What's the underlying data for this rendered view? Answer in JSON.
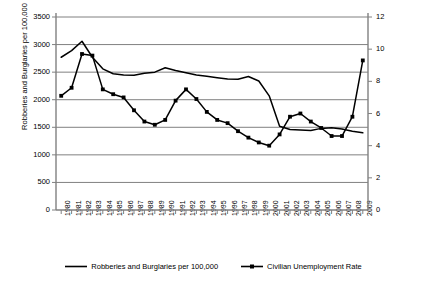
{
  "chart_data": {
    "type": "line",
    "title": "",
    "xlabel": "",
    "ylabel": "Robberies and Burglaries per 100,000",
    "ylabel_secondary": "Percentage Unemployed",
    "grid": true,
    "legend_position": "bottom",
    "categories": [
      "1980",
      "1981",
      "1982",
      "1983",
      "1984",
      "1985",
      "1986",
      "1987",
      "1988",
      "1989",
      "1990",
      "1991",
      "1992",
      "1993",
      "1994",
      "1995",
      "1996",
      "1997",
      "1998",
      "1999",
      "2000",
      "2001",
      "2002",
      "2003",
      "2004",
      "2005",
      "2006",
      "2007",
      "2008",
      "2009"
    ],
    "yaxis_left": {
      "label": "Robberies and Burglaries per 100,000",
      "ticks": [
        0,
        500,
        1000,
        1500,
        2000,
        2500,
        3000,
        3500
      ],
      "ylim": [
        0,
        3500
      ]
    },
    "yaxis_right": {
      "label": "Percentage Unemployed",
      "ticks": [
        0,
        2,
        4,
        6,
        8,
        10,
        12
      ],
      "ylim": [
        0,
        12
      ]
    },
    "series": [
      {
        "name": "Robberies and Burglaries per 100,000",
        "axis": "left",
        "marker": "none",
        "color": "#000000",
        "values": [
          2770,
          2890,
          3060,
          2770,
          2560,
          2470,
          2450,
          2445,
          2480,
          2500,
          2580,
          2530,
          2490,
          2450,
          2425,
          2400,
          2375,
          2370,
          2420,
          2340,
          2070,
          1520,
          1460,
          1450,
          1440,
          1480,
          1490,
          1470,
          1430,
          1400
        ]
      },
      {
        "name": "Civilian Unemployment Rate",
        "axis": "right",
        "marker": "square",
        "color": "#000000",
        "values": [
          7.1,
          7.6,
          9.7,
          9.6,
          7.5,
          7.2,
          7.0,
          6.2,
          5.5,
          5.3,
          5.6,
          6.8,
          7.5,
          6.9,
          6.1,
          5.6,
          5.4,
          4.9,
          4.5,
          4.2,
          4.0,
          4.7,
          5.8,
          6.0,
          5.5,
          5.1,
          4.6,
          4.6,
          5.8,
          9.3
        ]
      }
    ]
  },
  "legend": {
    "items": [
      {
        "label": "Robberies and Burglaries per 100,000",
        "marker": "line"
      },
      {
        "label": "Civilian Unemployment Rate",
        "marker": "line-square"
      }
    ]
  }
}
